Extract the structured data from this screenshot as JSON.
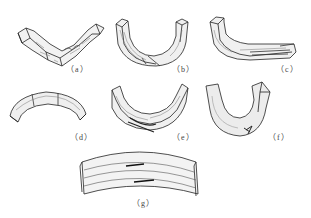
{
  "figure": {
    "panels": [
      {
        "id": "a",
        "label": "（a）",
        "shape": "shallow V-bend with compression wrinkles on inner face"
      },
      {
        "id": "b",
        "label": "（b）",
        "shape": "deep U-bend with shear split at bottom"
      },
      {
        "id": "c",
        "label": "（c）",
        "shape": "L-bend with delamination at one end"
      },
      {
        "id": "d",
        "label": "（d）",
        "shape": "arched segment with cross-grain cracks"
      },
      {
        "id": "e",
        "label": "（e）",
        "shape": "U-bend with fibre splitting on outer face"
      },
      {
        "id": "f",
        "label": "（f）",
        "shape": "narrow U-bend with fracture at bottom"
      },
      {
        "id": "g",
        "label": "（g）",
        "shape": "wide shallow arch with layered lamination"
      }
    ],
    "colors": {
      "ink": "#222222",
      "hatch": "#555555",
      "background": "#ffffff"
    }
  }
}
